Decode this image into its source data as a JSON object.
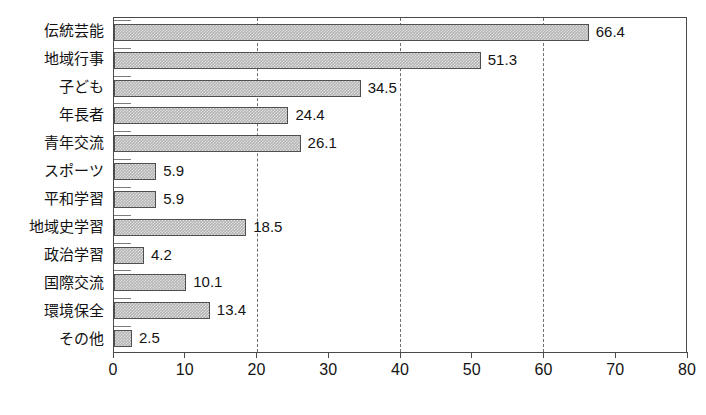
{
  "chart_data": {
    "type": "bar",
    "orientation": "horizontal",
    "title": "",
    "xlabel": "",
    "ylabel": "",
    "xlim": [
      0,
      80
    ],
    "xticks": [
      0,
      10,
      20,
      30,
      40,
      50,
      60,
      70,
      80
    ],
    "gridlines": [
      20,
      40,
      60
    ],
    "grid": true,
    "grid_style": "dashed",
    "legend": "none",
    "bar_fill_color": "#b4b4b4",
    "bar_edge_color": "#4f4f4f",
    "axis_color": "#4a4a4a",
    "categories": [
      "伝統芸能",
      "地域行事",
      "子ども",
      "年長者",
      "青年交流",
      "スポーツ",
      "平和学習",
      "地域史学習",
      "政治学習",
      "国際交流",
      "環境保全",
      "その他"
    ],
    "values": [
      66.4,
      51.3,
      34.5,
      24.4,
      26.1,
      5.9,
      5.9,
      18.5,
      4.2,
      10.1,
      13.4,
      2.5
    ],
    "value_labels": [
      "66.4",
      "51.3",
      "34.5",
      "24.4",
      "26.1",
      "5.9",
      "5.9",
      "18.5",
      "4.2",
      "10.1",
      "13.4",
      "2.5"
    ],
    "xtick_labels": [
      "0",
      "10",
      "20",
      "30",
      "40",
      "50",
      "60",
      "70",
      "80"
    ]
  }
}
